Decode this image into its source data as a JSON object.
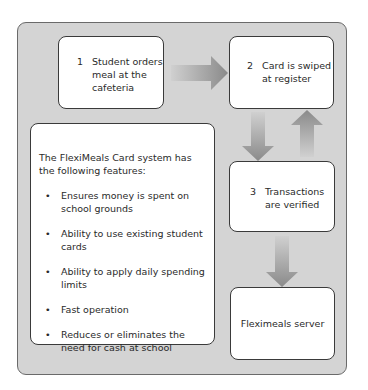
{
  "diagram": {
    "steps": [
      {
        "number": "1",
        "text_lines": [
          "Student orders",
          "meal at the",
          "cafeteria"
        ]
      },
      {
        "number": "2",
        "text_lines": [
          "Card is swiped",
          "at register"
        ]
      },
      {
        "number": "3",
        "text_lines": [
          "Transactions",
          "are verified"
        ]
      }
    ],
    "server": {
      "label": "Fleximeals server"
    },
    "features": {
      "intro": "The FlexiMeals Card system has the following features:",
      "items": [
        "Ensures money is spent on school grounds",
        "Ability to use existing student cards",
        "Ability to apply daily spending limits",
        "Fast operation",
        "Reduces or eliminates the need for cash at school"
      ]
    },
    "colors": {
      "panel": "#d4d4d4",
      "arrow": "#8c8c8c",
      "box": "#ffffff"
    }
  }
}
